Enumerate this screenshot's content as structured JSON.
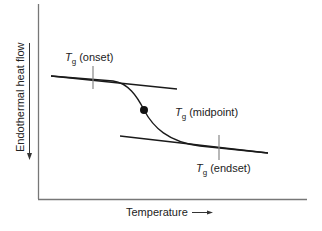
{
  "diagram": {
    "y_axis_label": "Endothermal heat flow",
    "x_axis_label": "Temperature",
    "x_arrow": "right-arrow",
    "y_arrow": "down-arrow",
    "annotations": {
      "onset": {
        "symbol": "T",
        "subscript": "g",
        "text": "(onset)"
      },
      "midpoint": {
        "symbol": "T",
        "subscript": "g",
        "text": "(midpoint)"
      },
      "endset": {
        "symbol": "T",
        "subscript": "g",
        "text": "(endset)"
      }
    },
    "colors": {
      "axis": "#777777",
      "curve": "#1a1a1a",
      "tick": "#888888",
      "text": "#222222"
    }
  }
}
